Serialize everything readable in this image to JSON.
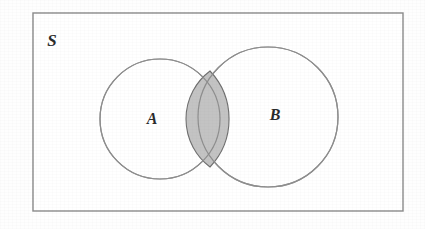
{
  "figure": {
    "kind": "venn-diagram",
    "width": 425,
    "height": 229,
    "background_color": "#fefefe"
  },
  "universe": {
    "label": "S",
    "label_x": 52,
    "label_y": 46,
    "rect": {
      "x": 33,
      "y": 13,
      "width": 370,
      "height": 198
    },
    "border_color": "#8a8a8a",
    "border_width": 1.4,
    "fill_color": "#ffffff"
  },
  "sets": [
    {
      "name": "set-a",
      "label": "A",
      "label_x": 152,
      "label_y": 124,
      "cx": 160,
      "cy": 119,
      "r": 60,
      "stroke_color": "#8e8e8e",
      "stroke_width": 1.2,
      "fill_color": "#ffffff"
    },
    {
      "name": "set-b",
      "label": "B",
      "label_x": 275,
      "label_y": 120,
      "cx": 268,
      "cy": 117,
      "r": 70,
      "stroke_color": "#8e8e8e",
      "stroke_width": 1.2,
      "fill_color": "#ffffff"
    }
  ],
  "intersection": {
    "name": "a-intersect-b",
    "label": "",
    "fill_color": "#c3c3c3",
    "stroke_color": "#6f6f6f",
    "stroke_width": 1.1,
    "top_point": {
      "x": 210,
      "y": 71
    },
    "bottom_point": {
      "x": 210,
      "y": 167
    },
    "path": "M 210 71 A 60 60 0 0 0 210 167 A 70 70 0 0 0 210 71 Z"
  }
}
